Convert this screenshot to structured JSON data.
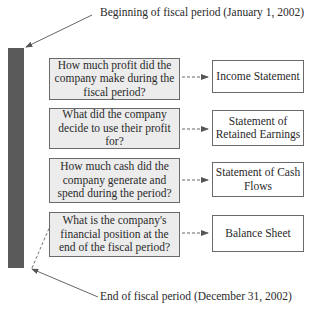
{
  "labels": {
    "beginning": "Beginning of fiscal period (January 1, 2002)",
    "end": "End of fiscal period (December 31, 2002)"
  },
  "rows": [
    {
      "question": "How much profit did the company make during the fiscal period?",
      "statement": "Income Statement"
    },
    {
      "question": "What did the company decide to use their profit for?",
      "statement": "Statement of Retained Earnings"
    },
    {
      "question": "How much cash did the company generate and spend during the period?",
      "statement": "Statement of Cash Flows"
    },
    {
      "question": "What is the company's financial position at the end of the fiscal period?",
      "statement": "Balance Sheet"
    }
  ],
  "colors": {
    "bar": "#5a5a5a",
    "question_fill": "#ececec",
    "statement_fill": "#ffffff",
    "border": "#6a6a6a"
  }
}
